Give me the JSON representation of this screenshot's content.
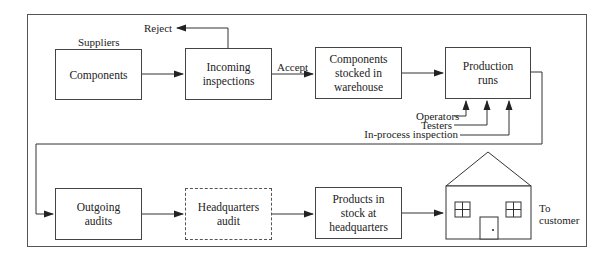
{
  "diagram": {
    "type": "process-flow",
    "nodes": [
      {
        "id": "components",
        "label": "Components",
        "caption": "Suppliers"
      },
      {
        "id": "incoming",
        "label": "Incoming\ninspections"
      },
      {
        "id": "stocked",
        "label": "Components\nstocked in\nwarehouse"
      },
      {
        "id": "production",
        "label": "Production\nruns"
      },
      {
        "id": "outgoing",
        "label": "Outgoing\naudits"
      },
      {
        "id": "hq_audit",
        "label": "Headquarters\naudit",
        "style": "dashed"
      },
      {
        "id": "products_stock",
        "label": "Products in\nstock at\nheadquarters"
      },
      {
        "id": "house",
        "label": "",
        "icon": "house-icon"
      }
    ],
    "edge_labels": {
      "reject": "Reject",
      "accept": "Accept",
      "to_customer": "To\ncustomer"
    },
    "inputs": {
      "operators": "Operators",
      "testers": "Testers",
      "in_process": "In-process inspection"
    },
    "edges": [
      {
        "from": "components",
        "to": "incoming"
      },
      {
        "from": "incoming",
        "to": "reject",
        "label": "Reject"
      },
      {
        "from": "incoming",
        "to": "stocked",
        "label": "Accept"
      },
      {
        "from": "stocked",
        "to": "production"
      },
      {
        "from": "operators",
        "to": "production"
      },
      {
        "from": "testers",
        "to": "production"
      },
      {
        "from": "in_process",
        "to": "production"
      },
      {
        "from": "production",
        "to": "outgoing"
      },
      {
        "from": "outgoing",
        "to": "hq_audit"
      },
      {
        "from": "hq_audit",
        "to": "products_stock"
      },
      {
        "from": "products_stock",
        "to": "house"
      },
      {
        "from": "house",
        "to": "customer",
        "label": "To customer"
      }
    ],
    "colors": {
      "line": "#444444",
      "background": "#ffffff"
    }
  }
}
